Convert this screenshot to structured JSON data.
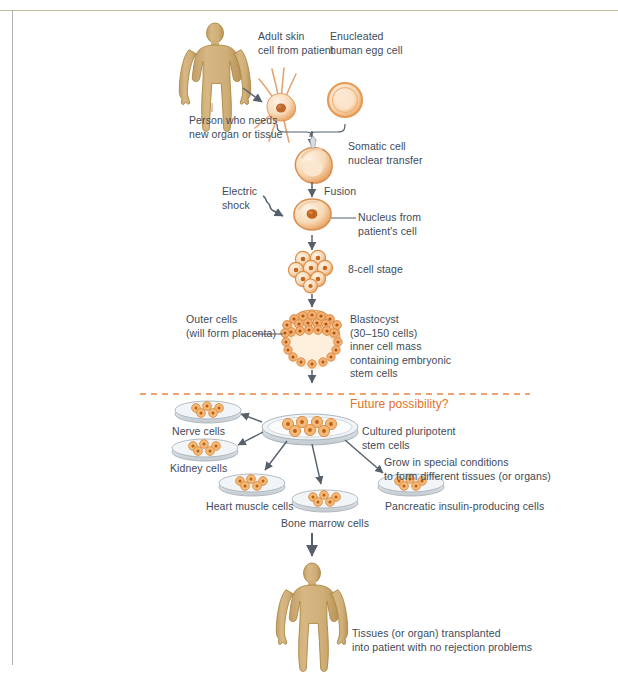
{
  "figure": {
    "title_text": "",
    "colors": {
      "body_tan": "#cfae78",
      "body_outline": "#a8873f",
      "cell_orange": "#e8924a",
      "cell_light": "#f6cfa3",
      "cell_fill": "#fbe2c4",
      "dish_gray": "#c9cfd4",
      "arrow_gray": "#55606b",
      "text": "#3d4a58",
      "accent_orange": "#e2702a",
      "divider_orange": "#e8873f",
      "frame_olive": "#b9bf9e"
    },
    "divider": {
      "style": "dashed",
      "color": "#e8873f"
    }
  },
  "labels": {
    "adult_skin_cell": "Adult skin\ncell from patient",
    "enucleated_egg": "Enucleated\nhuman egg cell",
    "person_needs": "Person who needs\nnew organ or tissue",
    "somatic_transfer": "Somatic cell\nnuclear transfer",
    "electric_shock": "Electric\nshock",
    "fusion": "Fusion",
    "nucleus_from": "Nucleus from\npatient's cell",
    "eight_cell_stage": "8-cell stage",
    "outer_cells": "Outer cells\n(will form placenta)",
    "blastocyst": "Blastocyst\n(30–150 cells)\ninner cell mass\ncontaining embryonic\nstem cells",
    "future_possibility": "Future possibility?",
    "nerve_cells": "Nerve cells",
    "kidney_cells": "Kidney cells",
    "heart_muscle_cells": "Heart muscle cells",
    "bone_marrow_cells": "Bone marrow cells",
    "cultured_pluripotent": "Cultured pluripotent\nstem cells",
    "grow_special": "Grow in special conditions\nto form different tissues (or organs)",
    "pancreatic_cells": "Pancreatic insulin-producing cells",
    "tissues_transplanted": "Tissues (or organ) transplanted\ninto patient with no rejection problems"
  }
}
